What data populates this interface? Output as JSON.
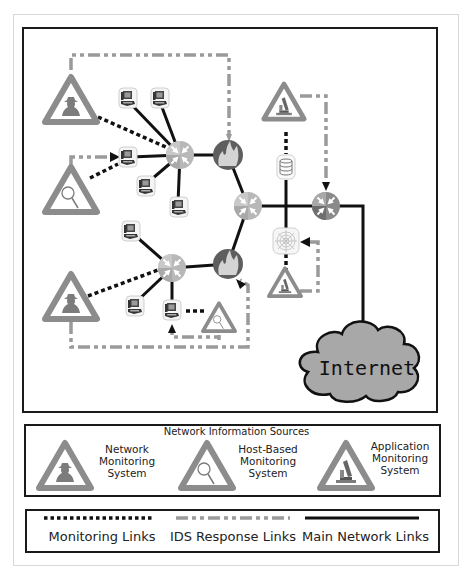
{
  "diagram": {
    "internet_label": "Internet",
    "nodes": {
      "routers": [
        "router-1",
        "router-2",
        "router-3",
        "router-4"
      ],
      "firewalls": [
        "firewall-1",
        "firewall-2"
      ],
      "workstations_count": 9,
      "database": "database-server",
      "web_server": "web-server",
      "cloud": "Internet"
    }
  },
  "legend_sources": {
    "title": "Network Information Sources",
    "items": [
      {
        "icon": "network-monitoring-icon",
        "line1": "Network",
        "line2": "Monitoring",
        "line3": "System"
      },
      {
        "icon": "host-monitoring-icon",
        "line1": "Host-Based",
        "line2": "Monitoring",
        "line3": "System"
      },
      {
        "icon": "application-monitoring-icon",
        "line1": "Application",
        "line2": "Monitoring",
        "line3": "System"
      }
    ]
  },
  "legend_links": {
    "items": [
      {
        "style": "dotted",
        "label": "Monitoring Links"
      },
      {
        "style": "dash-dot",
        "label": "IDS Response Links"
      },
      {
        "style": "solid",
        "label": "Main Network Links"
      }
    ]
  },
  "colors": {
    "triangle": "#8c8c8c",
    "router_light": "#b4b4b4",
    "router_dark": "#7a7a7a",
    "firewall": "#606060",
    "ids_response": "#9a9a9a",
    "monitoring": "#111111",
    "main_link": "#111111",
    "cloud": "#a8a8a8"
  }
}
